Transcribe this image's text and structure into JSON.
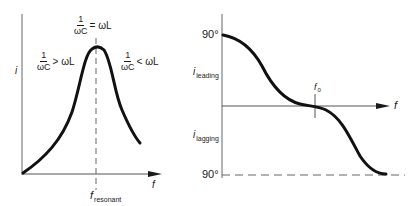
{
  "diagrams": {
    "left": {
      "name": "current-vs-frequency",
      "y_axis_label": "i",
      "x_axis_label": "f",
      "resonance_label_main": "f",
      "resonance_label_sub": "resonant",
      "annotations": {
        "top": {
          "num": "1",
          "den": "ωC",
          "rel": "= ωL"
        },
        "left": {
          "num": "1",
          "den": "ωC",
          "rel": "> ωL"
        },
        "right": {
          "num": "1",
          "den": "ωC",
          "rel": "< ωL"
        }
      }
    },
    "right": {
      "name": "phase-vs-frequency",
      "top_value": "90°",
      "bottom_value": "90°",
      "upper_label_main": "i",
      "upper_label_sub": "leading",
      "lower_label_main": "i",
      "lower_label_sub": "lagging",
      "x_axis_label": "f",
      "resonance_label_main": "f",
      "resonance_label_sub": "0"
    }
  },
  "colors": {
    "ink": "#1a1a1a",
    "axis": "#555555",
    "background": "#ffffff"
  }
}
